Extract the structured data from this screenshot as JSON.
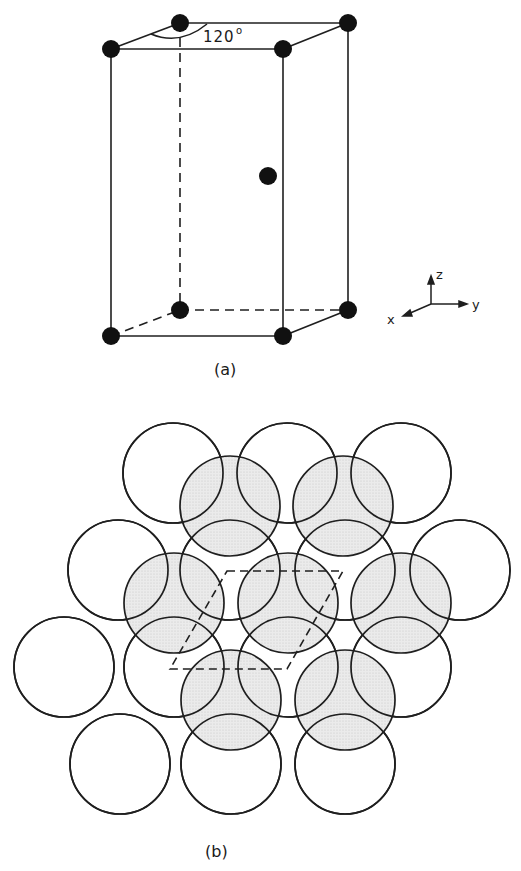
{
  "figure_a": {
    "caption": "(a)",
    "angle_label": "120°",
    "angle_value": "120",
    "angle_degree_symbol": "o",
    "axes": {
      "x": "x",
      "y": "y",
      "z": "z"
    },
    "corners_top": [
      [
        111,
        49
      ],
      [
        180,
        23
      ],
      [
        348,
        23
      ],
      [
        283,
        49
      ]
    ],
    "corners_bottom": [
      [
        111,
        336
      ],
      [
        180,
        310
      ],
      [
        348,
        310
      ],
      [
        283,
        336
      ]
    ],
    "interior_atom": [
      268,
      176
    ],
    "atom_radius": 9
  },
  "figure_b": {
    "caption": "(b)",
    "circle_radius": 50,
    "layer_a_circles": [
      [
        173,
        473
      ],
      [
        287,
        473
      ],
      [
        401,
        473
      ],
      [
        118,
        570
      ],
      [
        230,
        570
      ],
      [
        345,
        570
      ],
      [
        460,
        570
      ],
      [
        64,
        667
      ],
      [
        174,
        667
      ],
      [
        288,
        667
      ],
      [
        401,
        667
      ],
      [
        120,
        764
      ],
      [
        231,
        764
      ],
      [
        345,
        764
      ]
    ],
    "layer_b_circles": [
      [
        230,
        506
      ],
      [
        343,
        506
      ],
      [
        174,
        603
      ],
      [
        288,
        603
      ],
      [
        401,
        603
      ],
      [
        231,
        700
      ],
      [
        345,
        700
      ]
    ],
    "unit_cell_rhombus": [
      [
        227,
        571
      ],
      [
        343,
        571
      ],
      [
        287,
        669
      ],
      [
        170,
        669
      ]
    ],
    "colors": {
      "line": "#1f1f1f",
      "layer_b_fill": "#e4e4e4"
    }
  }
}
